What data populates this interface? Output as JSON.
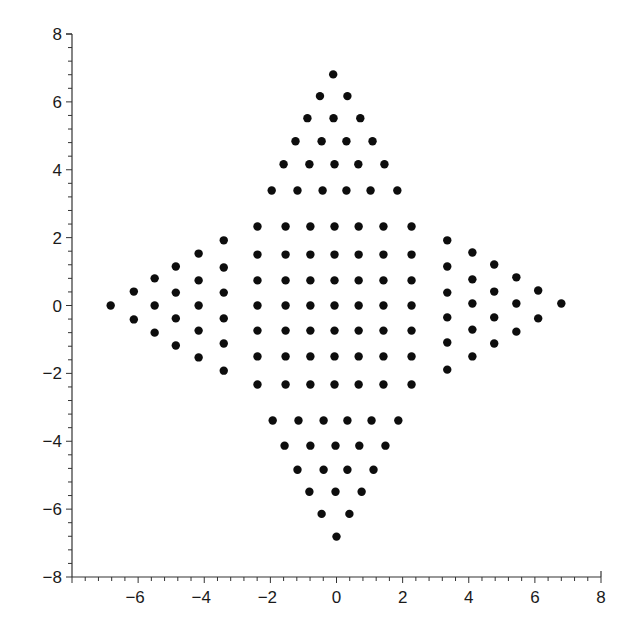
{
  "chart_data": {
    "type": "scatter",
    "title": "",
    "xlabel": "",
    "ylabel": "",
    "xlim": [
      -8,
      8
    ],
    "ylim": [
      -8,
      8
    ],
    "grid": false,
    "legend": null,
    "x_ticks": [
      -6,
      -4,
      -2,
      0,
      2,
      4,
      6,
      8
    ],
    "x_tick_labels": [
      "−6",
      "−4",
      "−2",
      "0",
      "2",
      "4",
      "6",
      "8"
    ],
    "y_ticks": [
      8,
      6,
      4,
      2,
      0,
      -2,
      -4,
      -6,
      -8
    ],
    "y_tick_labels": [
      "8",
      "6",
      "4",
      "2",
      "0",
      "−2",
      "−4",
      "−6",
      "−8"
    ],
    "minor_tick_step": 0.4,
    "marker": {
      "shape": "circle",
      "color": "#0d0d0d",
      "radius_px": 4.2
    },
    "series": [
      {
        "name": "top-triangle",
        "points": [
          [
            -0.1,
            6.81
          ],
          [
            -0.5,
            6.17
          ],
          [
            0.33,
            6.17
          ],
          [
            -0.88,
            5.52
          ],
          [
            -0.09,
            5.52
          ],
          [
            0.72,
            5.52
          ],
          [
            -1.24,
            4.84
          ],
          [
            -0.45,
            4.84
          ],
          [
            0.3,
            4.84
          ],
          [
            1.09,
            4.84
          ],
          [
            -1.6,
            4.16
          ],
          [
            -0.82,
            4.16
          ],
          [
            -0.06,
            4.16
          ],
          [
            0.66,
            4.16
          ],
          [
            1.45,
            4.16
          ],
          [
            -1.96,
            3.39
          ],
          [
            -1.18,
            3.39
          ],
          [
            -0.42,
            3.39
          ],
          [
            0.3,
            3.39
          ],
          [
            1.03,
            3.39
          ],
          [
            1.84,
            3.39
          ]
        ]
      },
      {
        "name": "central-square",
        "x_values": [
          -2.39,
          -1.54,
          -0.79,
          -0.06,
          0.67,
          1.42,
          2.27
        ],
        "y_values": [
          2.33,
          1.5,
          0.74,
          0,
          -0.74,
          -1.5,
          -2.33
        ]
      },
      {
        "name": "bottom-triangle",
        "points": [
          [
            -1.93,
            -3.39
          ],
          [
            -1.15,
            -3.39
          ],
          [
            -0.39,
            -3.39
          ],
          [
            0.33,
            -3.39
          ],
          [
            1.06,
            -3.39
          ],
          [
            1.87,
            -3.39
          ],
          [
            -1.57,
            -4.13
          ],
          [
            -0.79,
            -4.13
          ],
          [
            -0.03,
            -4.13
          ],
          [
            0.69,
            -4.13
          ],
          [
            1.48,
            -4.13
          ],
          [
            -1.18,
            -4.84
          ],
          [
            -0.39,
            -4.84
          ],
          [
            0.33,
            -4.84
          ],
          [
            1.12,
            -4.84
          ],
          [
            -0.82,
            -5.49
          ],
          [
            -0.03,
            -5.49
          ],
          [
            0.76,
            -5.49
          ],
          [
            -0.45,
            -6.14
          ],
          [
            0.39,
            -6.14
          ],
          [
            0.0,
            -6.81
          ]
        ]
      },
      {
        "name": "left-triangle",
        "points": [
          [
            -6.83,
            0.0
          ],
          [
            -6.13,
            0.41
          ],
          [
            -6.13,
            -0.41
          ],
          [
            -5.5,
            0.8
          ],
          [
            -5.5,
            0.0
          ],
          [
            -5.5,
            -0.8
          ],
          [
            -4.86,
            1.15
          ],
          [
            -4.86,
            0.38
          ],
          [
            -4.86,
            -0.38
          ],
          [
            -4.86,
            -1.18
          ],
          [
            -4.17,
            1.53
          ],
          [
            -4.17,
            0.74
          ],
          [
            -4.17,
            0.0
          ],
          [
            -4.17,
            -0.74
          ],
          [
            -4.17,
            -1.53
          ],
          [
            -3.41,
            1.92
          ],
          [
            -3.41,
            1.12
          ],
          [
            -3.41,
            0.38
          ],
          [
            -3.41,
            -0.38
          ],
          [
            -3.41,
            -1.12
          ],
          [
            -3.41,
            -1.92
          ]
        ]
      },
      {
        "name": "right-triangle",
        "points": [
          [
            3.35,
            1.92
          ],
          [
            3.35,
            1.15
          ],
          [
            3.35,
            0.38
          ],
          [
            3.35,
            -0.35
          ],
          [
            3.35,
            -1.09
          ],
          [
            3.35,
            -1.89
          ],
          [
            4.11,
            1.56
          ],
          [
            4.11,
            0.77
          ],
          [
            4.11,
            0.06
          ],
          [
            4.11,
            -0.71
          ],
          [
            4.11,
            -1.5
          ],
          [
            4.77,
            1.21
          ],
          [
            4.77,
            0.41
          ],
          [
            4.77,
            -0.35
          ],
          [
            4.77,
            -1.12
          ],
          [
            5.44,
            0.83
          ],
          [
            5.44,
            0.06
          ],
          [
            5.44,
            -0.77
          ],
          [
            6.1,
            0.44
          ],
          [
            6.1,
            -0.38
          ],
          [
            6.8,
            0.06
          ]
        ]
      }
    ]
  }
}
